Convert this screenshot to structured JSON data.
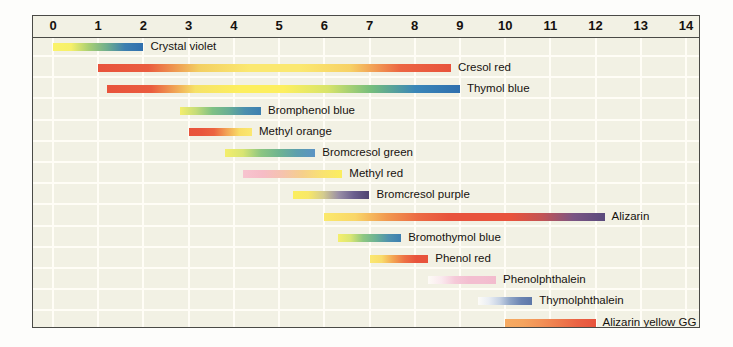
{
  "figure": {
    "background_color": "#f2f1e4",
    "frame_color": "#4a4a46",
    "grid_color": "#fffdf6",
    "text_color": "#16120f"
  },
  "axis": {
    "label": "pH",
    "ticks": [
      "0",
      "1",
      "2",
      "3",
      "4",
      "5",
      "6",
      "7",
      "8",
      "9",
      "10",
      "11",
      "12",
      "13",
      "14"
    ],
    "min": 0,
    "max": 14
  },
  "chart_data": {
    "type": "bar",
    "xlabel": "pH",
    "ylabel": "",
    "xlim": [
      0,
      14
    ],
    "grid": true,
    "legend_position": "inline-right",
    "orientation": "horizontal-range",
    "categories": [
      "Crystal violet",
      "Cresol red",
      "Thymol blue",
      "Bromphenol blue",
      "Methyl orange",
      "Bromcresol green",
      "Methyl red",
      "Bromcresol purple",
      "Alizarin",
      "Bromothymol blue",
      "Phenol red",
      "Phenolphthalein",
      "Thymolphthalein",
      "Alizarin yellow GG",
      "Universal indicator"
    ],
    "ranges": [
      {
        "name": "Crystal violet",
        "start": 0.0,
        "end": 2.0,
        "colors": [
          "#fbf36a",
          "#f6f06a",
          "#a8cf74",
          "#6fae8e",
          "#3d7fb0",
          "#2f6fae"
        ]
      },
      {
        "name": "Cresol red",
        "start": 1.0,
        "end": 8.8,
        "colors": [
          "#e8533c",
          "#ea5c3f",
          "#f3cf62",
          "#fbe870",
          "#fbe870",
          "#f7d165",
          "#ec6542",
          "#e8533c"
        ]
      },
      {
        "name": "Thymol blue",
        "start": 1.2,
        "end": 9.0,
        "colors": [
          "#e8533c",
          "#ea5b3e",
          "#f6e268",
          "#fdef5f",
          "#fdef5f",
          "#d8e46a",
          "#74bd7d",
          "#3a86b8",
          "#2f6fae"
        ]
      },
      {
        "name": "Bromphenol blue",
        "start": 2.8,
        "end": 4.6,
        "colors": [
          "#f4ee6c",
          "#c4dc78",
          "#7fc184",
          "#68ae94",
          "#4b8fae",
          "#3d7fb0"
        ]
      },
      {
        "name": "Methyl orange",
        "start": 3.0,
        "end": 4.4,
        "colors": [
          "#e8543c",
          "#e9563d",
          "#ec6440",
          "#f2a455",
          "#f9dd66",
          "#fbe870"
        ]
      },
      {
        "name": "Bromcresol green",
        "start": 3.8,
        "end": 5.8,
        "colors": [
          "#f4ee6c",
          "#d8e573",
          "#8cc682",
          "#6eb490",
          "#5c9fae",
          "#5b93c4"
        ]
      },
      {
        "name": "Methyl red",
        "start": 4.2,
        "end": 6.4,
        "colors": [
          "#f7c4cf",
          "#f6bcc6",
          "#f5c3ae",
          "#f6cf8b",
          "#f9e272",
          "#fbee5e"
        ]
      },
      {
        "name": "Bromcresol purple",
        "start": 5.3,
        "end": 7.0,
        "colors": [
          "#fbee5e",
          "#f8e867",
          "#d4cc8f",
          "#9a8fa6",
          "#6b5f8e",
          "#4f4470"
        ]
      },
      {
        "name": "Alizarin",
        "start": 6.0,
        "end": 12.2,
        "colors": [
          "#fbe96b",
          "#f9d668",
          "#f1994f",
          "#ec6b44",
          "#e8533c",
          "#e8533c",
          "#e8533c",
          "#c25455",
          "#7a5584",
          "#5a4a7c"
        ]
      },
      {
        "name": "Bromothymol blue",
        "start": 6.3,
        "end": 7.7,
        "colors": [
          "#f5ef6c",
          "#d9e673",
          "#8dc781",
          "#6cb294",
          "#4f92ae",
          "#3d7fb0"
        ]
      },
      {
        "name": "Phenol red",
        "start": 7.0,
        "end": 8.3,
        "colors": [
          "#fbe870",
          "#f9dc6b",
          "#f3a452",
          "#ed7045",
          "#e8533c",
          "#e8533c"
        ]
      },
      {
        "name": "Phenolphthalein",
        "start": 8.3,
        "end": 9.8,
        "colors": [
          "#fdfbf6",
          "#fae9ee",
          "#f5c9d8",
          "#f3bed0",
          "#f3bed0",
          "#f2bbcd"
        ]
      },
      {
        "name": "Thymolphthalein",
        "start": 9.4,
        "end": 10.6,
        "colors": [
          "#fdfcf8",
          "#eaeef4",
          "#c6d2e4",
          "#8ea4c6",
          "#6b84b2",
          "#5d77a8"
        ]
      },
      {
        "name": "Alizarin yellow GG",
        "start": 10.0,
        "end": 12.0,
        "colors": [
          "#f6ab62",
          "#f5a45e",
          "#f29157",
          "#ee7a4c",
          "#ea6243",
          "#e8533c"
        ]
      },
      {
        "name": "Universal indicator",
        "start": 1.0,
        "end": 9.8,
        "colors": [
          "#e8453a",
          "#e8533c",
          "#ee7a45",
          "#f3a352",
          "#f8d463",
          "#fbee66",
          "#e3ea74",
          "#b9cf8d",
          "#95a7a2",
          "#8d8ca6",
          "#8d6fa0",
          "#7a4f8f",
          "#6b3f80"
        ]
      }
    ]
  }
}
